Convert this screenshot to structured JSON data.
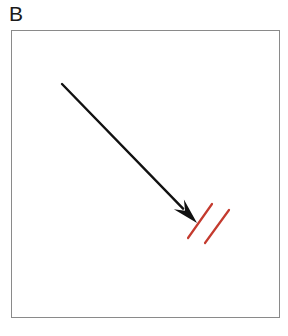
{
  "figure": {
    "panel_label": "B",
    "background_color": "#ffffff",
    "width": 288,
    "height": 336
  },
  "frame": {
    "name": "panel-border-box",
    "x": 11,
    "y": 30,
    "width": 269,
    "height": 288,
    "border_color": "#8a8a8a",
    "border_width": 1,
    "fill_color": "#ffffff"
  },
  "annotations": {
    "arrow": {
      "name": "black-pointer-arrow",
      "color": "#111111",
      "shaft_width": 2.4,
      "tail_x": 62,
      "tail_y": 84,
      "tip_x": 197,
      "tip_y": 223,
      "head_length": 26,
      "head_half_width": 7,
      "direction": "down-right"
    },
    "marker_lines": {
      "name": "red-parallel-marker-lines",
      "color": "#c43a2e",
      "stroke_width": 2.2,
      "count": 2,
      "lines": [
        {
          "label": "red-line-1",
          "x1": 188,
          "y1": 238,
          "x2": 212,
          "y2": 204
        },
        {
          "label": "red-line-2",
          "x1": 205,
          "y1": 243,
          "x2": 229,
          "y2": 210
        }
      ]
    }
  }
}
